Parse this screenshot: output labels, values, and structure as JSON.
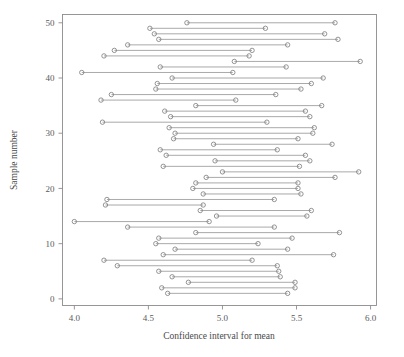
{
  "chart_data": {
    "type": "line",
    "title": "",
    "subtitle": "",
    "xlabel": "Confidence interval for mean",
    "ylabel": "Sample number",
    "xlim": [
      3.92,
      6.04
    ],
    "ylim": [
      -1.2,
      51.5
    ],
    "xticks": [
      4.0,
      4.5,
      5.0,
      5.5,
      6.0
    ],
    "xtick_labels": [
      "4.0",
      "4.5",
      "5.0",
      "5.5",
      "6.0"
    ],
    "yticks": [
      0,
      10,
      20,
      30,
      40,
      50
    ],
    "ytick_labels": [
      "0",
      "10",
      "20",
      "30",
      "40",
      "50"
    ],
    "grid": false,
    "legend": null,
    "marker": "open-circle",
    "series_note": "Each row is one sample's confidence interval: lower bound, upper bound at its sample number.",
    "intervals": [
      {
        "sample": 50,
        "lower": 4.76,
        "upper": 5.76
      },
      {
        "sample": 49,
        "lower": 4.51,
        "upper": 5.29
      },
      {
        "sample": 48,
        "lower": 4.54,
        "upper": 5.69
      },
      {
        "sample": 47,
        "lower": 4.57,
        "upper": 5.78
      },
      {
        "sample": 46,
        "lower": 4.36,
        "upper": 5.44
      },
      {
        "sample": 45,
        "lower": 4.27,
        "upper": 5.2
      },
      {
        "sample": 44,
        "lower": 4.2,
        "upper": 5.18
      },
      {
        "sample": 43,
        "lower": 5.08,
        "upper": 5.93
      },
      {
        "sample": 42,
        "lower": 4.58,
        "upper": 5.43
      },
      {
        "sample": 41,
        "lower": 4.05,
        "upper": 5.07
      },
      {
        "sample": 40,
        "lower": 4.66,
        "upper": 5.68
      },
      {
        "sample": 39,
        "lower": 4.56,
        "upper": 5.6
      },
      {
        "sample": 38,
        "lower": 4.55,
        "upper": 5.53
      },
      {
        "sample": 37,
        "lower": 4.25,
        "upper": 5.36
      },
      {
        "sample": 36,
        "lower": 4.18,
        "upper": 5.09
      },
      {
        "sample": 35,
        "lower": 4.82,
        "upper": 5.67
      },
      {
        "sample": 34,
        "lower": 4.61,
        "upper": 5.56
      },
      {
        "sample": 33,
        "lower": 4.65,
        "upper": 5.59
      },
      {
        "sample": 32,
        "lower": 4.19,
        "upper": 5.3
      },
      {
        "sample": 31,
        "lower": 4.64,
        "upper": 5.62
      },
      {
        "sample": 30,
        "lower": 4.68,
        "upper": 5.61
      },
      {
        "sample": 29,
        "lower": 4.67,
        "upper": 5.51
      },
      {
        "sample": 28,
        "lower": 4.94,
        "upper": 5.74
      },
      {
        "sample": 27,
        "lower": 4.58,
        "upper": 5.37
      },
      {
        "sample": 26,
        "lower": 4.62,
        "upper": 5.56
      },
      {
        "sample": 25,
        "lower": 4.95,
        "upper": 5.59
      },
      {
        "sample": 24,
        "lower": 4.6,
        "upper": 5.52
      },
      {
        "sample": 23,
        "lower": 5.0,
        "upper": 5.92
      },
      {
        "sample": 22,
        "lower": 4.89,
        "upper": 5.76
      },
      {
        "sample": 21,
        "lower": 4.82,
        "upper": 5.51
      },
      {
        "sample": 20,
        "lower": 4.8,
        "upper": 5.51
      },
      {
        "sample": 19,
        "lower": 4.87,
        "upper": 5.53
      },
      {
        "sample": 18,
        "lower": 4.22,
        "upper": 5.35
      },
      {
        "sample": 17,
        "lower": 4.21,
        "upper": 4.87
      },
      {
        "sample": 16,
        "lower": 4.85,
        "upper": 5.6
      },
      {
        "sample": 15,
        "lower": 4.96,
        "upper": 5.57
      },
      {
        "sample": 14,
        "lower": 4.0,
        "upper": 4.91
      },
      {
        "sample": 13,
        "lower": 4.36,
        "upper": 5.35
      },
      {
        "sample": 12,
        "lower": 4.82,
        "upper": 5.79
      },
      {
        "sample": 11,
        "lower": 4.57,
        "upper": 5.47
      },
      {
        "sample": 10,
        "lower": 4.55,
        "upper": 5.24
      },
      {
        "sample": 9,
        "lower": 4.68,
        "upper": 5.44
      },
      {
        "sample": 8,
        "lower": 4.6,
        "upper": 5.75
      },
      {
        "sample": 7,
        "lower": 4.2,
        "upper": 5.2
      },
      {
        "sample": 6,
        "lower": 4.29,
        "upper": 5.37
      },
      {
        "sample": 5,
        "lower": 4.57,
        "upper": 5.38
      },
      {
        "sample": 4,
        "lower": 4.66,
        "upper": 5.39
      },
      {
        "sample": 3,
        "lower": 4.77,
        "upper": 5.49
      },
      {
        "sample": 2,
        "lower": 4.59,
        "upper": 5.49
      },
      {
        "sample": 1,
        "lower": 4.63,
        "upper": 5.44
      }
    ]
  }
}
